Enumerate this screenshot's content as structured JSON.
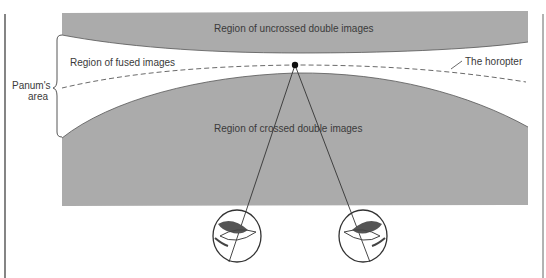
{
  "diagram": {
    "type": "binocular-vision-horopter",
    "labels": {
      "uncrossed": "Region of uncrossed double images",
      "fused": "Region of fused images",
      "crossed": "Region of crossed double images",
      "horopter": "The horopter",
      "panum_line1": "Panum's",
      "panum_line2": "area"
    },
    "colors": {
      "region_fill": "#ababab",
      "line": "#3a3a3a",
      "background": "#ffffff"
    },
    "elements": [
      "fixation-point",
      "left-eye",
      "right-eye",
      "horopter-curve",
      "panum-brace",
      "sight-lines"
    ]
  }
}
